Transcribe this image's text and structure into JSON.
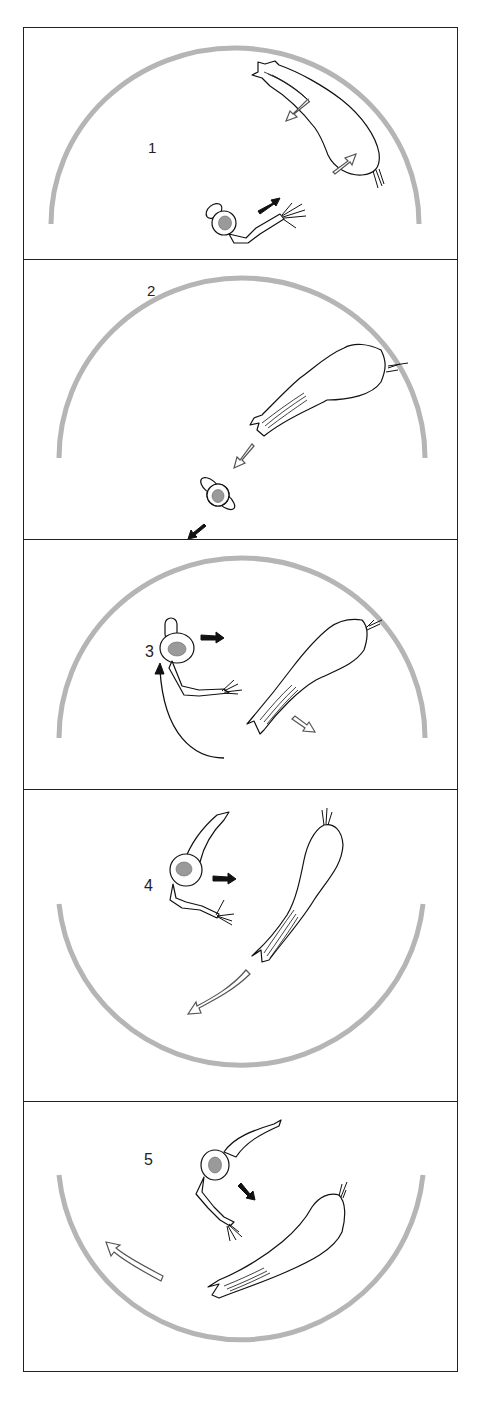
{
  "figure": {
    "panel_count": 5,
    "colors": {
      "frame": "#222222",
      "arena_arc": "#b5b5b5",
      "eye_fill": "#9a9a9a",
      "line_art": "#111111",
      "open_arrow": "#555555"
    },
    "panels": [
      {
        "label": "1",
        "arena": "upper-semicircle",
        "arrows": [
          "open arrow: predator retreats down-left",
          "open arrow: toward predator tail",
          "solid arrow: prey moves up-right"
        ]
      },
      {
        "label": "2",
        "arena": "upper-semicircle",
        "arrows": [
          "open arrow: predator lunges down-left",
          "solid arrow: prey moves down-left"
        ]
      },
      {
        "label": "3",
        "arena": "upper-semicircle",
        "arrows": [
          "solid arrow: prey moves right",
          "open arrow: predator moves down-right",
          "curved line arrow: prey path upward"
        ]
      },
      {
        "label": "4",
        "arena": "lower-semicircle",
        "arrows": [
          "solid arrow: prey moves right",
          "open curved arrow: predator sweeps down-left"
        ]
      },
      {
        "label": "5",
        "arena": "lower-semicircle",
        "arrows": [
          "solid arrow: prey moves down-right",
          "open curved arrow: predator sweeps up-left"
        ]
      }
    ]
  }
}
